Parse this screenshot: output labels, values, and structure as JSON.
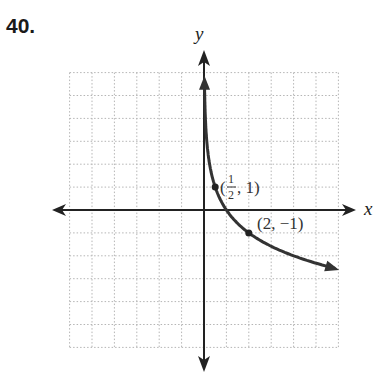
{
  "problem": {
    "number": "40."
  },
  "chart_data": {
    "type": "line",
    "title": "",
    "function": "y = log_{1/2}(x)",
    "xlabel": "x",
    "ylabel": "y",
    "xlim": [
      -6,
      6
    ],
    "ylim": [
      -6,
      6
    ],
    "grid": true,
    "grid_style": "dotted",
    "series": [
      {
        "name": "curve",
        "x": [
          0.02,
          0.05,
          0.1,
          0.25,
          0.5,
          1,
          2,
          3,
          4,
          5,
          6
        ],
        "y": [
          5.64,
          4.32,
          3.32,
          2,
          1,
          0,
          -1,
          -1.58,
          -2,
          -2.32,
          -2.58
        ]
      }
    ],
    "annotations": [
      {
        "point": [
          0.5,
          1
        ],
        "label_prefix": "(",
        "label_num": "1",
        "label_den": "2",
        "label_suffix": ", 1)"
      },
      {
        "point": [
          2,
          -1
        ],
        "label": "(2, −1)"
      }
    ]
  },
  "colors": {
    "curve": "#333333",
    "axis": "#222222",
    "grid": "#b5b5b5"
  }
}
